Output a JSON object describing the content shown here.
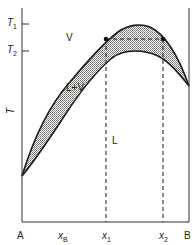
{
  "diagram": {
    "type": "binary-phase-diagram-with-maximum-azeotrope-region",
    "y_axis": {
      "label": "T",
      "ticks": [
        {
          "label": "T",
          "sub": "1"
        },
        {
          "label": "T",
          "sub": "2"
        }
      ]
    },
    "x_axis": {
      "left_end": "A",
      "right_end": "B",
      "variable": {
        "label": "x",
        "sub": "B"
      },
      "markers": [
        {
          "label": "x",
          "sub": "1"
        },
        {
          "label": "x",
          "sub": "2"
        }
      ]
    },
    "regions": {
      "vapor": "V",
      "two_phase": "L+V",
      "liquid": "L"
    },
    "colors": {
      "line": "#1a1a1a",
      "shade": "#bdbdbd",
      "background": "#ffffff"
    }
  }
}
